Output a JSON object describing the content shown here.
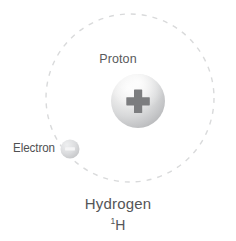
{
  "diagram": {
    "background_color": "#ffffff",
    "labels": {
      "proton": "Proton",
      "electron": "Electron",
      "element_name": "Hydrogen",
      "isotope_mass_number": "1",
      "isotope_element_symbol": "H"
    },
    "symbols": {
      "proton_charge": "plus-sign",
      "electron_charge": "minus-sign"
    },
    "colors": {
      "text": "#58595b",
      "orbit_dash": "#d9dadb",
      "proton_fill_light": "#f2f2f2",
      "proton_fill_dark": "#b5b6b8",
      "proton_sign": "#7a7b7d",
      "electron_fill_light": "#e2e3e4",
      "electron_fill_dark": "#c6c7c9",
      "electron_sign": "#f4f4f5"
    },
    "geometry": {
      "orbit_center_x": 130,
      "orbit_center_y": 98,
      "orbit_radius": 84,
      "orbit_dash_pattern": "5 6",
      "proton_center_x": 138,
      "proton_center_y": 101,
      "proton_radius": 27,
      "electron_center_x": 70,
      "electron_center_y": 149,
      "electron_radius": 9.5
    }
  }
}
